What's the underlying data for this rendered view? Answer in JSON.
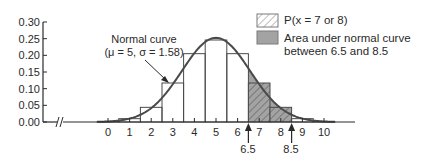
{
  "chart_data": {
    "type": "bar",
    "title": "",
    "xlabel": "",
    "ylabel": "",
    "categories": [
      "0",
      "1",
      "2",
      "3",
      "4",
      "5",
      "6",
      "7",
      "8",
      "9",
      "10"
    ],
    "x": [
      0,
      1,
      2,
      3,
      4,
      5,
      6,
      7,
      8,
      9,
      10
    ],
    "values": [
      0.001,
      0.01,
      0.044,
      0.117,
      0.205,
      0.246,
      0.205,
      0.117,
      0.044,
      0.01,
      0.001
    ],
    "ylim": [
      0,
      0.3
    ],
    "y_ticks": [
      "0.00",
      "0.05",
      "0.10",
      "0.15",
      "0.20",
      "0.25",
      "0.30"
    ],
    "x_ticks": [
      "0",
      "1",
      "2",
      "3",
      "4",
      "5",
      "6",
      "7",
      "8",
      "9",
      "10"
    ],
    "grid": false,
    "axis_break": true,
    "series": [
      {
        "name": "Binomial probabilities",
        "type": "bar",
        "values": [
          0.001,
          0.01,
          0.044,
          0.117,
          0.205,
          0.246,
          0.205,
          0.117,
          0.044,
          0.01,
          0.001
        ]
      },
      {
        "name": "Normal curve",
        "type": "line",
        "mu": 5,
        "sigma": 1.58
      }
    ],
    "highlight": {
      "hatched_bars": [
        7,
        8
      ],
      "shaded_range": [
        6.5,
        8.5
      ]
    },
    "annotations": {
      "curve_label_line1": "Normal curve",
      "curve_label_line2": "(μ = 5, σ = 1.58)",
      "arrow_left": "6.5",
      "arrow_right": "8.5"
    },
    "legend": [
      {
        "label": "P(x = 7 or 8)",
        "style": "hatched"
      },
      {
        "label_line1": "Area under normal curve",
        "label_line2": "between 6.5 and 8.5",
        "style": "shaded"
      }
    ],
    "legend_position": "top-right",
    "colors": {
      "line": "#4a4a4a",
      "bar_edge": "#4a4a4a",
      "shade": "#a3a3a3",
      "hatch": "#5a5a5a"
    }
  }
}
